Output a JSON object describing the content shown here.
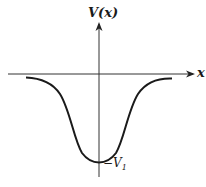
{
  "figure": {
    "y_axis_label": "V(x)",
    "x_axis_label": "x",
    "minimum_label_prefix": "−V",
    "minimum_label_subscript": "1",
    "curve_description": "Potential well: V(x) approaches 0 as |x| grows, minimum −V1 at x = 0",
    "colors": {
      "ink": "#1a1a1a",
      "background": "#ffffff"
    }
  }
}
